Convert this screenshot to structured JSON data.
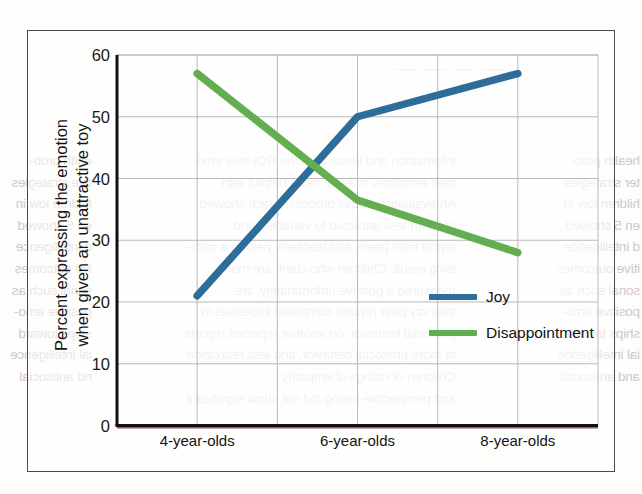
{
  "page": {
    "bleed_top": "— — — —",
    "bleed_left_column": "ealth prob-\ntive strategies\nhildren low in\nen 5 showed\nd intelligence\nive outcomes\nsonal such as\npositive emo-\nships toward\nial intelligence\nnd antisocial",
    "bleed_mid_column": "information and ideas from the ROI less emo-\ntheir emotions, may be more helpful with\nAn evaluation of this process, which showed\nchildren less attracted to variables and\nreport from peers and teachers yielded a com-\nising result. Children who stank are more\nmeasured a positive unfortunately, are\ntheir cry peer reports correlated increases in\nprosocial behavior, on another reported reports in brinks\nto more prosocial behavior, and less relaxation\nChildren of ratings of empathy\nand perspective-taking did not show significant",
    "bleed_right_column": "health prob-\nter strategies\nhildren low in\nen 5 showed\nd intelligence\nitive outcomes\nsonal such as\npositive emo-\nships toward\nial intelligence\nand antisocial"
  },
  "chart_data": {
    "type": "line",
    "title": "",
    "xlabel": "",
    "ylabel": "Percent expressing the emotion when given an unattractive toy",
    "ylabel_lines": [
      "Percent expressing the emotion",
      "when given an unattractive toy"
    ],
    "categories": [
      "4-year-olds",
      "6-year-olds",
      "8-year-olds"
    ],
    "yticks": [
      0,
      10,
      20,
      30,
      40,
      50,
      60
    ],
    "ylim": [
      0,
      60
    ],
    "grid": true,
    "legend_position": "inside-right-lower",
    "series": [
      {
        "name": "Joy",
        "color": "#2e6d99",
        "values": [
          21,
          50,
          57
        ]
      },
      {
        "name": "Disappointment",
        "color": "#63ae51",
        "values": [
          57,
          36.5,
          28
        ]
      }
    ],
    "baseline_artifact_color": "#a8478f"
  }
}
